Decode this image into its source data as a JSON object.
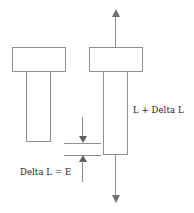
{
  "figure": {
    "background_color": "#ffffff",
    "line_color": "#8f8f8f",
    "text_color": "#1a1a1a",
    "width_px": 194,
    "height_px": 213
  },
  "labels": {
    "elongation": "Delta L = E",
    "stretched_length": "L + Delta L"
  },
  "specimens": {
    "unloaded": {
      "name": "unloaded-specimen",
      "head": {
        "x": 12,
        "y": 47,
        "w": 54,
        "h": 25
      },
      "shaft": {
        "x": 26,
        "y": 71,
        "w": 25,
        "h": 71
      }
    },
    "loaded": {
      "name": "loaded-specimen",
      "head": {
        "x": 89,
        "y": 47,
        "w": 54,
        "h": 25
      },
      "shaft": {
        "x": 103,
        "y": 71,
        "w": 25,
        "h": 84
      }
    }
  },
  "annotations": {
    "load_arrow_up": "tensile-load-upward",
    "load_arrow_down": "tensile-load-downward",
    "dimension_upper": "elongation-upper-bound",
    "dimension_lower": "elongation-lower-bound"
  }
}
